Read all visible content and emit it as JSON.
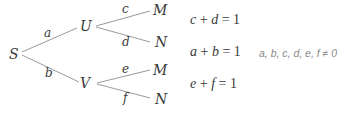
{
  "tree": {
    "root": {
      "label": "S"
    },
    "level1": [
      {
        "label": "U",
        "edge": "a"
      },
      {
        "label": "V",
        "edge": "b"
      }
    ],
    "level2": [
      {
        "parent": "U",
        "label": "M",
        "edge": "c"
      },
      {
        "parent": "U",
        "label": "N",
        "edge": "d"
      },
      {
        "parent": "V",
        "label": "M",
        "edge": "e"
      },
      {
        "parent": "V",
        "label": "N",
        "edge": "f"
      }
    ]
  },
  "equations": [
    {
      "lhs1": "c",
      "op": "+",
      "lhs2": "d",
      "eq": "=",
      "rhs": "1"
    },
    {
      "lhs1": "a",
      "op": "+",
      "lhs2": "b",
      "eq": "=",
      "rhs": "1"
    },
    {
      "lhs1": "e",
      "op": "+",
      "lhs2": "f",
      "eq": "=",
      "rhs": "1"
    }
  ],
  "condition": "a, b, c, d, e, f ≠ 0",
  "colors": {
    "ink": "#3a3a3a",
    "line": "#9a9a9a",
    "note": "#8a8a8a"
  }
}
